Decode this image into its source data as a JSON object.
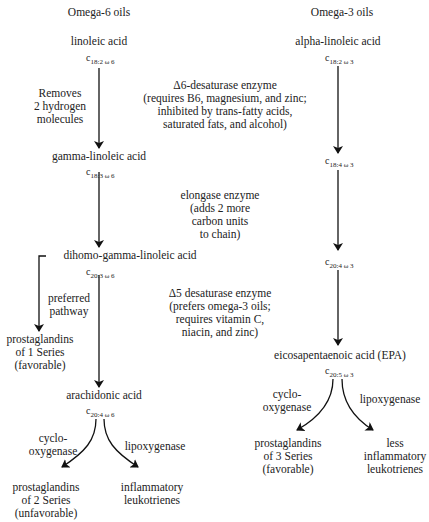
{
  "columns": {
    "omega6": {
      "title": "Omega-6 oils",
      "nodes": [
        {
          "name": "linoleic acid",
          "formula": {
            "c": "c",
            "sub": "18:2 ω 6"
          }
        },
        {
          "name": "gamma-linoleic acid",
          "formula": {
            "c": "c",
            "sub": "18:3 ω 6"
          }
        },
        {
          "name": "dihomo-gamma-linoleic acid",
          "formula": {
            "c": "c",
            "sub": "20:3 ω 6"
          }
        },
        {
          "name": "arachidonic acid",
          "formula": {
            "c": "c",
            "sub": "20:4 ω 6"
          }
        }
      ],
      "side_labels": {
        "removes": [
          "Removes",
          "2 hydrogen",
          "molecules"
        ],
        "preferred": [
          "preferred",
          "pathway"
        ],
        "cyclo": [
          "cyclo-",
          "oxygenase"
        ],
        "lipo": "lipoxygenase"
      },
      "outputs": {
        "pg1": [
          "prostaglandins",
          "of 1 Series",
          "(favorable)"
        ],
        "pg2": [
          "prostaglandins",
          "of 2 Series",
          "(unfavorable)"
        ],
        "leuko": [
          "inflammatory",
          "leukotrienes"
        ]
      }
    },
    "omega3": {
      "title": "Omega-3 oils",
      "nodes": [
        {
          "name": "alpha-linoleic acid",
          "formula": {
            "c": "c",
            "sub": "18:2 ω 3"
          }
        },
        {
          "name": "",
          "formula": {
            "c": "c",
            "sub": "18:4 ω 3"
          }
        },
        {
          "name": "",
          "formula": {
            "c": "c",
            "sub": "20:4 ω 3"
          }
        },
        {
          "name": "eicosapentaenoic acid (EPA)",
          "formula": {
            "c": "c",
            "sub": "20:5 ω 3"
          }
        }
      ],
      "side_labels": {
        "cyclo": [
          "cyclo-",
          "oxygenase"
        ],
        "lipo": "lipoxygenase"
      },
      "outputs": {
        "pg3": [
          "prostaglandins",
          "of 3 Series",
          "(favorable)"
        ],
        "leuko": [
          "less",
          "inflammatory",
          "leukotrienes"
        ]
      }
    }
  },
  "enzymes": {
    "d6": [
      "Δ6-desaturase enzyme",
      "(requires B6, magnesium, and zinc;",
      "inhibited by trans-fatty acids,",
      "saturated fats, and alcohol)"
    ],
    "elongase": [
      "elongase enzyme",
      "(adds 2 more",
      "carbon units",
      "to chain)"
    ],
    "d5": [
      "Δ5 desaturase enzyme",
      "(prefers omega-3 oils;",
      "requires vitamin C,",
      "niacin, and zinc)"
    ]
  }
}
